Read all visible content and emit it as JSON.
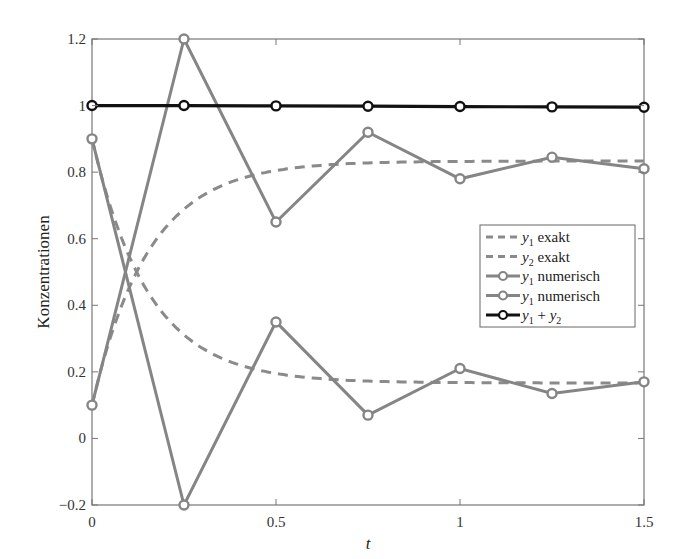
{
  "chart_data": {
    "type": "line",
    "title": "",
    "xlabel": "t",
    "ylabel": "Konzentrationen",
    "xlim": [
      0,
      1.5
    ],
    "ylim": [
      -0.2,
      1.2
    ],
    "xticks": [
      0,
      0.5,
      1,
      1.5
    ],
    "xtick_labels": [
      "0",
      "0.5",
      "1",
      "1.5"
    ],
    "yticks": [
      -0.2,
      0,
      0.2,
      0.4,
      0.6,
      0.8,
      1,
      1.2
    ],
    "ytick_labels": [
      "−0.2",
      "0",
      "0.2",
      "0.4",
      "0.6",
      "0.8",
      "1",
      "1.2"
    ],
    "grid": false,
    "legend_position": "center right",
    "x": [
      0,
      0.25,
      0.5,
      0.75,
      1.0,
      1.25,
      1.5
    ],
    "series": [
      {
        "name": "y1 exakt",
        "label_main": "y",
        "label_sub": "1",
        "label_rest": " exakt",
        "style": "dashed",
        "color": "#8a8a8a",
        "formula": "0.8333 - 0.7333*exp(-6.5 t)",
        "values": [
          0.1,
          0.68,
          0.805,
          0.827,
          0.832,
          0.833,
          0.833
        ]
      },
      {
        "name": "y2 exakt",
        "label_main": "y",
        "label_sub": "2",
        "label_rest": " exakt",
        "style": "dashed",
        "color": "#8a8a8a",
        "formula": "0.1667 + 0.7333*exp(-6.5 t)",
        "values": [
          0.9,
          0.32,
          0.195,
          0.173,
          0.168,
          0.167,
          0.167
        ]
      },
      {
        "name": "y1 numerisch",
        "label_main": "y",
        "label_sub": "1",
        "label_rest": " numerisch",
        "style": "solid-marker",
        "color": "#858585",
        "values": [
          0.1,
          1.2,
          0.65,
          0.92,
          0.78,
          0.845,
          0.81
        ]
      },
      {
        "name": "y1 numerisch",
        "label_main": "y",
        "label_sub": "1",
        "label_rest": " numerisch",
        "style": "solid-marker",
        "color": "#858585",
        "values": [
          0.9,
          -0.2,
          0.35,
          0.07,
          0.21,
          0.135,
          0.17
        ]
      },
      {
        "name": "y1 + y2",
        "label_main": "y",
        "label_sub": "1",
        "label_rest": " + ",
        "label_main2": "y",
        "label_sub2": "2",
        "style": "solid-marker",
        "color": "#111111",
        "values": [
          1.0,
          1.0,
          0.999,
          0.998,
          0.997,
          0.996,
          0.995
        ]
      }
    ]
  }
}
